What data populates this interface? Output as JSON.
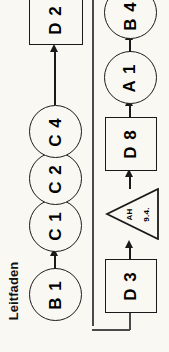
{
  "diagram": {
    "title": "Leitfaden",
    "orientation": "rotated-90-ccw",
    "background_color": "#faf8f2",
    "stroke_color": "#1a1a1a",
    "rows": [
      {
        "name": "upper-chain",
        "nodes": [
          {
            "id": "B1",
            "label": "B 1",
            "shape": "circle"
          },
          {
            "id": "C1",
            "label": "C 1",
            "shape": "circle"
          },
          {
            "id": "C2",
            "label": "C 2",
            "shape": "circle"
          },
          {
            "id": "C4",
            "label": "C 4",
            "shape": "circle"
          },
          {
            "id": "D2",
            "label": "D 2",
            "shape": "box"
          }
        ]
      },
      {
        "name": "lower-chain",
        "nodes": [
          {
            "id": "D3",
            "label": "D 3",
            "shape": "box"
          },
          {
            "id": "AH",
            "label": "AH",
            "sublabel": "9.4.",
            "shape": "triangle"
          },
          {
            "id": "D8",
            "label": "D 8",
            "shape": "box"
          },
          {
            "id": "A1",
            "label": "A 1",
            "shape": "circle"
          },
          {
            "id": "B4",
            "label": "B 4",
            "shape": "circle"
          }
        ]
      }
    ],
    "connectors": [
      {
        "from": "B1",
        "to": "C1",
        "type": "arrow"
      },
      {
        "from": "C4",
        "to": "D2",
        "type": "arrow"
      },
      {
        "from": "D3",
        "to": "AH",
        "type": "arrow"
      },
      {
        "from": "AH",
        "to": "D8",
        "type": "arrow"
      },
      {
        "from": "D8",
        "to": "A1",
        "type": "arrow"
      },
      {
        "from": "A1",
        "to": "B4",
        "type": "arrow"
      },
      {
        "from": "B4",
        "to": "D3",
        "type": "feedback-loop"
      }
    ]
  }
}
